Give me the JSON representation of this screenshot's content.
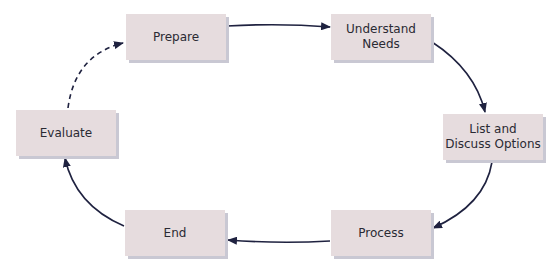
{
  "diagram": {
    "type": "cycle-flow",
    "node_fill": "#e6dcde",
    "node_shadow": "#c9c8d3",
    "arrow_color": "#1f2240",
    "nodes": [
      {
        "id": "prepare",
        "label_lines": [
          "Prepare"
        ]
      },
      {
        "id": "understand-needs",
        "label_lines": [
          "Understand",
          "Needs"
        ]
      },
      {
        "id": "list-discuss-options",
        "label_lines": [
          "List and",
          "Discuss Options"
        ]
      },
      {
        "id": "process",
        "label_lines": [
          "Process"
        ]
      },
      {
        "id": "end",
        "label_lines": [
          "End"
        ]
      },
      {
        "id": "evaluate",
        "label_lines": [
          "Evaluate"
        ]
      }
    ],
    "edges": [
      {
        "from": "prepare",
        "to": "understand-needs",
        "style": "solid"
      },
      {
        "from": "understand-needs",
        "to": "list-discuss-options",
        "style": "solid"
      },
      {
        "from": "list-discuss-options",
        "to": "process",
        "style": "solid"
      },
      {
        "from": "process",
        "to": "end",
        "style": "solid"
      },
      {
        "from": "end",
        "to": "evaluate",
        "style": "solid"
      },
      {
        "from": "evaluate",
        "to": "prepare",
        "style": "dashed"
      }
    ]
  }
}
